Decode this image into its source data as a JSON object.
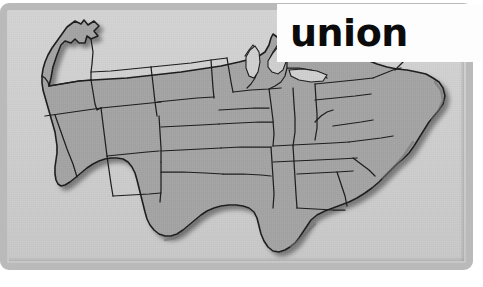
{
  "image": {
    "width": 483,
    "height": 287,
    "kind": "flashcard-map-image"
  },
  "label": {
    "word": "union",
    "text_color": "#0b0b0b",
    "background_color": "#fdfdfd"
  },
  "map": {
    "title": "United States map",
    "region": "Contiguous United States",
    "state_fill_color": "#a3a4a3",
    "state_border_color": "#1c1c1c",
    "water_background_color": "#cfd0cf",
    "frame_color": "#b9bab9",
    "shadow_color": "#6f706f",
    "states": [
      "Washington",
      "Oregon",
      "California",
      "Nevada",
      "Idaho",
      "Montana",
      "Wyoming",
      "Utah",
      "Arizona",
      "Colorado",
      "New Mexico",
      "North Dakota",
      "South Dakota",
      "Nebraska",
      "Kansas",
      "Oklahoma",
      "Texas",
      "Minnesota",
      "Iowa",
      "Missouri",
      "Arkansas",
      "Louisiana",
      "Wisconsin",
      "Illinois",
      "Michigan",
      "Indiana",
      "Ohio",
      "Kentucky",
      "Tennessee",
      "Mississippi",
      "Alabama",
      "Georgia",
      "Florida",
      "South Carolina",
      "North Carolina",
      "Virginia",
      "West Virginia",
      "Maryland",
      "Delaware",
      "Pennsylvania",
      "New Jersey",
      "New York",
      "Connecticut",
      "Rhode Island",
      "Massachusetts",
      "Vermont",
      "New Hampshire",
      "Maine"
    ]
  }
}
